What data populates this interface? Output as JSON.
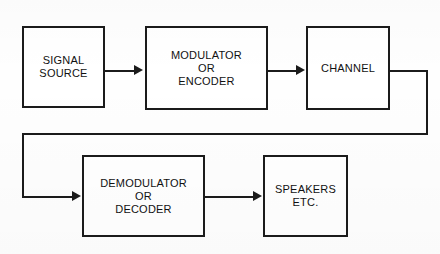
{
  "diagram": {
    "background_color": "#fefefe",
    "line_color": "#1b1b1b",
    "blocks": [
      {
        "id": "signal-source",
        "label": "SIGNAL\nSOURCE",
        "x": 22,
        "y": 26,
        "width": 83,
        "height": 82
      },
      {
        "id": "modulator-encoder",
        "label": "MODULATOR\nOR\nENCODER",
        "x": 145,
        "y": 26,
        "width": 123,
        "height": 84
      },
      {
        "id": "channel",
        "label": "CHANNEL",
        "x": 306,
        "y": 26,
        "width": 84,
        "height": 84
      },
      {
        "id": "demodulator-decoder",
        "label": "DEMODULATOR\nOR\nDECODER",
        "x": 82,
        "y": 155,
        "width": 123,
        "height": 82
      },
      {
        "id": "speakers",
        "label": "SPEAKERS\nETC.",
        "x": 263,
        "y": 155,
        "width": 85,
        "height": 82
      }
    ],
    "connections": [
      {
        "id": "signal-source-to-modulator",
        "from": "signal-source",
        "to": "modulator-encoder",
        "kind": "arrow-right"
      },
      {
        "id": "modulator-to-channel",
        "from": "modulator-encoder",
        "to": "channel",
        "kind": "arrow-right"
      },
      {
        "id": "channel-to-demodulator",
        "from": "channel",
        "to": "demodulator-decoder",
        "kind": "routed-wrap-arrow-right"
      },
      {
        "id": "demodulator-to-speakers",
        "from": "demodulator-decoder",
        "to": "speakers",
        "kind": "arrow-right"
      }
    ]
  }
}
